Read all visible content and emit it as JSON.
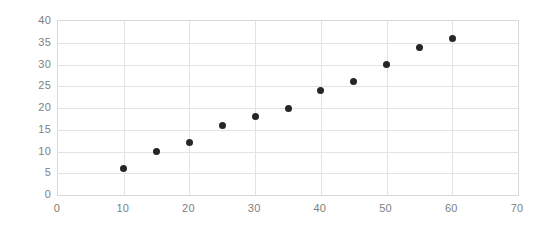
{
  "chart_data": {
    "type": "scatter",
    "title": "",
    "subtitle": "",
    "xlabel": "",
    "ylabel": "",
    "xlim": [
      0,
      70
    ],
    "ylim": [
      0,
      40
    ],
    "xticks": [
      0,
      10,
      20,
      30,
      40,
      50,
      60,
      70
    ],
    "yticks": [
      0,
      5,
      10,
      15,
      20,
      25,
      30,
      35,
      40
    ],
    "xtick_labels": [
      "0",
      "10",
      "20",
      "30",
      "40",
      "50",
      "60",
      "70"
    ],
    "ytick_labels": [
      "0",
      "5",
      "10",
      "15",
      "20",
      "25",
      "30",
      "35",
      "40"
    ],
    "grid": true,
    "grid_axis": "both",
    "legend": false,
    "legend_position": "none",
    "marker_color": "#262626",
    "marker_shape": "circle",
    "grid_color": "#e3e3e3",
    "frame_color": "#d9d9d9",
    "tick_label_color": "#808080",
    "background_color": "#ffffff",
    "series": [
      {
        "name": "series-1",
        "points": [
          {
            "x": 10,
            "y": 6
          },
          {
            "x": 15,
            "y": 10
          },
          {
            "x": 20,
            "y": 12
          },
          {
            "x": 25,
            "y": 16
          },
          {
            "x": 30,
            "y": 18
          },
          {
            "x": 35,
            "y": 20
          },
          {
            "x": 40,
            "y": 24
          },
          {
            "x": 45,
            "y": 26
          },
          {
            "x": 50,
            "y": 30
          },
          {
            "x": 55,
            "y": 34
          },
          {
            "x": 60,
            "y": 36
          }
        ]
      }
    ]
  }
}
